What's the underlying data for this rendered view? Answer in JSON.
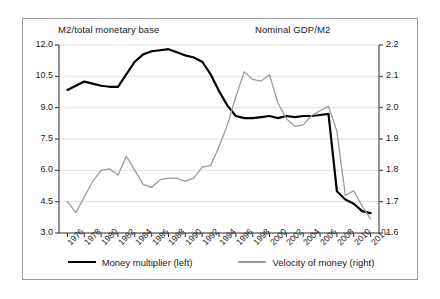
{
  "chart_data": {
    "type": "line",
    "title": "",
    "xlabel": "",
    "left_axis_title": "M2/total monetary base",
    "right_axis_title": "Nominal GDP/M2",
    "x": [
      1976,
      1977,
      1978,
      1979,
      1980,
      1981,
      1982,
      1983,
      1984,
      1985,
      1986,
      1987,
      1988,
      1989,
      1990,
      1991,
      1992,
      1993,
      1994,
      1995,
      1996,
      1997,
      1998,
      1999,
      2000,
      2001,
      2002,
      2003,
      2004,
      2005,
      2006,
      2007,
      2008,
      2009,
      2010,
      2011,
      2012
    ],
    "xlim": [
      1975,
      2013
    ],
    "xticks": [
      1976,
      1978,
      1980,
      1982,
      1984,
      1986,
      1988,
      1990,
      1992,
      1994,
      1996,
      1998,
      2000,
      2002,
      2004,
      2006,
      2008,
      2010,
      2012
    ],
    "xtick_labels": [
      "1976",
      "1978",
      "1980",
      "1982",
      "1984",
      "1986",
      "1988",
      "1990",
      "1992",
      "1994",
      "1996",
      "1998",
      "2000",
      "2002",
      "2004",
      "2006",
      "2008",
      "2010",
      "2012"
    ],
    "ylim": [
      3.0,
      12.0
    ],
    "yticks": [
      3.0,
      4.5,
      6.0,
      7.5,
      9.0,
      10.5,
      12.0
    ],
    "ytick_labels": [
      "3.0",
      "4.5",
      "6.0",
      "7.5",
      "9.0",
      "10.5",
      "12.0"
    ],
    "y2lim": [
      1.6,
      2.2
    ],
    "y2ticks": [
      1.6,
      1.7,
      1.8,
      1.9,
      2.0,
      2.1,
      2.2
    ],
    "y2tick_labels": [
      "1.6",
      "1.7",
      "1.8",
      "1.9",
      "2.0",
      "2.1",
      "2.2"
    ],
    "grid": true,
    "grid_axis": "y",
    "legend_position": "bottom",
    "series": [
      {
        "name": "Money multiplier (left)",
        "axis": "left",
        "color": "#000000",
        "values": [
          9.85,
          10.05,
          10.25,
          10.15,
          10.05,
          10.0,
          10.0,
          10.6,
          11.2,
          11.55,
          11.7,
          11.75,
          11.8,
          11.65,
          11.5,
          11.4,
          11.2,
          10.6,
          9.8,
          9.1,
          8.6,
          8.5,
          8.5,
          8.55,
          8.6,
          8.5,
          8.6,
          8.55,
          8.6,
          8.6,
          8.65,
          8.7,
          5.0,
          4.6,
          4.4,
          4.05,
          3.95
        ]
      },
      {
        "name": "Velocity of money (right)",
        "axis": "right",
        "color": "#9b9b9b",
        "values": [
          1.7,
          1.665,
          1.715,
          1.765,
          1.8,
          1.805,
          1.785,
          1.845,
          1.8,
          1.755,
          1.745,
          1.77,
          1.775,
          1.775,
          1.765,
          1.775,
          1.81,
          1.815,
          1.875,
          1.945,
          2.035,
          2.115,
          2.09,
          2.085,
          2.105,
          2.015,
          1.965,
          1.94,
          1.945,
          1.975,
          1.99,
          2.005,
          1.925,
          1.72,
          1.735,
          1.685,
          1.645
        ]
      }
    ]
  },
  "legend": {
    "entries": [
      {
        "label": "Money multiplier (left)",
        "swatch": "black-line-swatch"
      },
      {
        "label": "Velocity of money (right)",
        "swatch": "gray-line-swatch"
      }
    ]
  }
}
